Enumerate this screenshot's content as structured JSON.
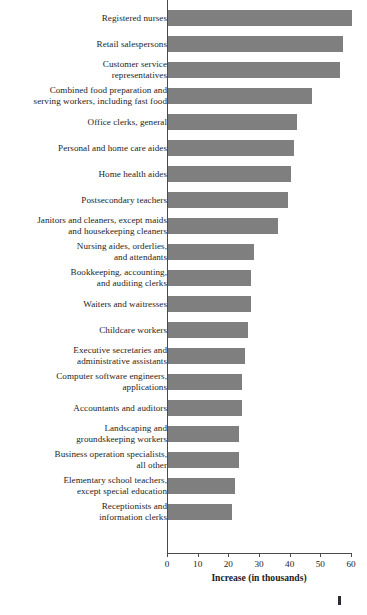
{
  "chart_data": {
    "type": "bar",
    "orientation": "horizontal",
    "title": "",
    "xlabel": "Increase (in thousands)",
    "ylabel": "",
    "xlim": [
      0,
      60
    ],
    "xticks": [
      0,
      10,
      20,
      30,
      40,
      50,
      60
    ],
    "grid": false,
    "legend": null,
    "bar_color": "#7f7f7f",
    "axis_color": "#4a4a4a",
    "categories": [
      "Registered nurses",
      "Retail salespersons",
      "Customer service\nrepresentatives",
      "Combined food preparation and\nserving workers, including fast food",
      "Office clerks, general",
      "Personal and home care aides",
      "Home health aides",
      "Postsecondary teachers",
      "Janitors and cleaners, except maids\nand housekeeping cleaners",
      "Nursing aides, orderlies,\nand attendants",
      "Bookkeeping, accounting,\nand auditing clerks",
      "Waiters and waitresses",
      "Childcare workers",
      "Executive secretaries and\nadministrative assistants",
      "Computer software engineers,\napplications",
      "Accountants and auditors",
      "Landscaping and\ngroundskeeping workers",
      "Business operation specialists,\nall other",
      "Elementary school teachers,\nexcept special education",
      "Receptionists and\ninformation clerks"
    ],
    "values": [
      60,
      57,
      56,
      47,
      42,
      41,
      40,
      39,
      36,
      28,
      27,
      27,
      26,
      25,
      24,
      24,
      23,
      23,
      22,
      21
    ]
  },
  "page": {
    "mark": ""
  }
}
